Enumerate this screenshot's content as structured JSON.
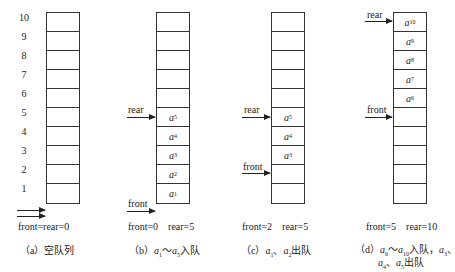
{
  "index_labels": [
    "10",
    "9",
    "8",
    "7",
    "6",
    "5",
    "4",
    "3",
    "2",
    "1"
  ],
  "panels": {
    "a": {
      "cells": [
        "",
        "",
        "",
        "",
        "",
        "",
        "",
        "",
        "",
        ""
      ],
      "status": "front=rear=0",
      "caption": "（a）空队列"
    },
    "b": {
      "cells": [
        "",
        "",
        "",
        "",
        "",
        "a5",
        "a4",
        "a3",
        "a2",
        "a1"
      ],
      "rear_label": "rear",
      "front_label": "front",
      "status": "front=0    rear=5",
      "caption": "（b）a1～a5入队"
    },
    "c": {
      "cells": [
        "",
        "",
        "",
        "",
        "",
        "a5",
        "a4",
        "a3",
        "",
        ""
      ],
      "rear_label": "rear",
      "front_label": "front",
      "status": "front=2    rear=5",
      "caption": "（c）a1、a2出队"
    },
    "d": {
      "cells": [
        "a10",
        "a9",
        "a8",
        "a7",
        "a6",
        "",
        "",
        "",
        "",
        ""
      ],
      "rear_label": "rear",
      "front_label": "front",
      "status": "front=5    rear=10",
      "caption_line1": "（d）a6～a10入队，a3、",
      "caption_line2": "a4、a5出队"
    }
  }
}
